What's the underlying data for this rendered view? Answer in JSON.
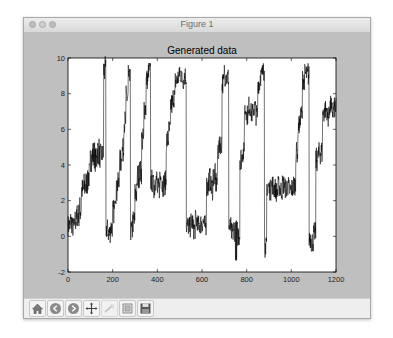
{
  "window": {
    "title": "Figure 1"
  },
  "toolbar": {
    "items": [
      {
        "name": "home",
        "label": "Home",
        "enabled": true
      },
      {
        "name": "back",
        "label": "Back",
        "enabled": true
      },
      {
        "name": "forward",
        "label": "Forward",
        "enabled": true
      },
      {
        "name": "pan",
        "label": "Pan",
        "enabled": true
      },
      {
        "name": "zoom",
        "label": "Zoom",
        "enabled": false
      },
      {
        "name": "subplots",
        "label": "Configure subplots",
        "enabled": true
      },
      {
        "name": "save",
        "label": "Save",
        "enabled": true
      }
    ]
  },
  "colors": {
    "line": "#000000",
    "axes_bg": "#ffffff",
    "figure_bg": "#bfbfbf"
  },
  "chart_data": {
    "type": "line",
    "title": "Generated data",
    "xlabel": "",
    "ylabel": "",
    "xlim": [
      0,
      1200
    ],
    "ylim": [
      -2,
      10
    ],
    "xticks": [
      0,
      200,
      400,
      600,
      800,
      1000,
      1200
    ],
    "yticks": [
      -2,
      0,
      2,
      4,
      6,
      8,
      10
    ],
    "grid": false,
    "legend": null,
    "series": [
      {
        "name": "data",
        "step": 10,
        "x_start": 0,
        "mean": [
          0.6,
          0.8,
          0.5,
          0.9,
          1.2,
          1.5,
          2.6,
          2.8,
          3.0,
          3.4,
          4.4,
          4.6,
          4.3,
          4.8,
          4.5,
          4.6,
          9.3,
          0.4,
          0.2,
          0.5,
          1.4,
          2.5,
          2.9,
          4.2,
          4.8,
          6.4,
          7.8,
          8.8,
          0.3,
          0.8,
          2.4,
          3.4,
          3.6,
          5.4,
          7.2,
          8.8,
          9.3,
          3.1,
          2.8,
          3.2,
          2.6,
          3.3,
          2.9,
          3.0,
          5.4,
          5.9,
          7.4,
          7.8,
          8.7,
          8.9,
          9.1,
          8.8,
          9.0,
          0.6,
          0.5,
          0.8,
          0.4,
          0.9,
          0.6,
          0.7,
          0.8,
          0.6,
          2.8,
          3.2,
          2.7,
          3.4,
          3.0,
          4.9,
          5.2,
          8.6,
          9.0,
          8.9,
          0.5,
          0.2,
          0.4,
          -0.2,
          0.1,
          4.4,
          4.7,
          7.1,
          6.8,
          7.3,
          6.9,
          7.2,
          6.8,
          8.6,
          9.0,
          9.2,
          -0.6,
          2.8,
          2.6,
          2.9,
          2.7,
          2.5,
          2.8,
          2.6,
          2.9,
          2.7,
          2.8,
          2.6,
          2.7,
          2.9,
          4.7,
          6.2,
          6.8,
          8.8,
          9.1,
          9.0,
          -0.1,
          -0.3,
          0.2,
          4.3,
          4.6,
          4.7,
          6.9,
          7.1,
          6.7,
          7.3,
          7.0,
          7.2,
          7.4
        ],
        "spread": [
          0.6,
          0.7,
          0.6,
          0.7,
          0.7,
          0.8,
          0.7,
          0.8,
          0.7,
          0.8,
          0.8,
          0.8,
          0.7,
          0.8,
          0.7,
          0.6,
          0.8,
          0.6,
          0.6,
          0.6,
          0.7,
          0.7,
          0.7,
          0.7,
          0.7,
          0.7,
          0.7,
          0.6,
          0.6,
          0.7,
          0.7,
          0.7,
          0.7,
          0.7,
          0.7,
          0.6,
          0.5,
          0.7,
          0.7,
          0.7,
          0.7,
          0.7,
          0.7,
          0.7,
          0.7,
          0.7,
          0.7,
          0.6,
          0.6,
          0.6,
          0.6,
          0.6,
          0.6,
          0.6,
          0.6,
          0.6,
          0.6,
          0.6,
          0.6,
          0.6,
          0.6,
          0.6,
          0.7,
          0.7,
          0.7,
          0.7,
          0.7,
          0.7,
          0.6,
          0.6,
          0.6,
          0.6,
          0.6,
          0.6,
          0.7,
          1.2,
          0.7,
          0.7,
          0.6,
          0.6,
          0.6,
          0.6,
          0.6,
          0.6,
          0.6,
          0.6,
          0.6,
          0.5,
          0.6,
          0.6,
          0.6,
          0.6,
          0.6,
          0.6,
          0.6,
          0.6,
          0.6,
          0.6,
          0.6,
          0.6,
          0.6,
          0.6,
          0.6,
          0.6,
          0.6,
          0.6,
          0.6,
          0.6,
          0.6,
          0.6,
          0.6,
          0.7,
          0.7,
          0.7,
          0.6,
          0.6,
          0.6,
          0.6,
          0.6,
          0.6,
          0.6
        ],
        "peaks": [
          {
            "x": 165,
            "y": 9.7
          },
          {
            "x": 270,
            "y": 9.6
          },
          {
            "x": 365,
            "y": 9.7
          },
          {
            "x": 500,
            "y": 9.5
          },
          {
            "x": 700,
            "y": 9.6
          },
          {
            "x": 755,
            "y": -1.3
          },
          {
            "x": 875,
            "y": 9.7
          },
          {
            "x": 885,
            "y": -1.0
          },
          {
            "x": 1075,
            "y": 9.7
          }
        ]
      }
    ]
  }
}
